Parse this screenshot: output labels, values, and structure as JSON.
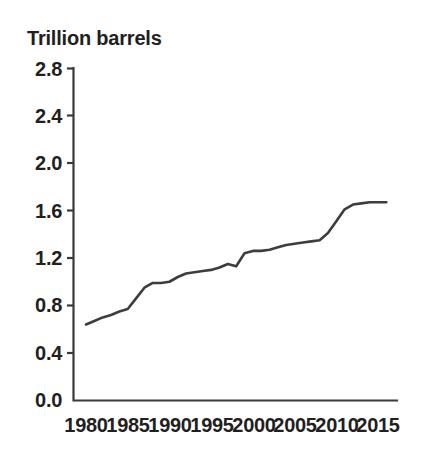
{
  "chart_data": {
    "type": "line",
    "title": "Trillion barrels",
    "subtitle": "",
    "xlabel": "",
    "ylabel": "Trillion barrels",
    "xlim": [
      1980,
      2016
    ],
    "ylim": [
      0.0,
      2.8
    ],
    "grid": false,
    "legend": false,
    "y_ticks": [
      "0.0",
      "0.4",
      "0.8",
      "1.2",
      "1.6",
      "2.0",
      "2.4",
      "2.8"
    ],
    "y_tick_values": [
      0.0,
      0.4,
      0.8,
      1.2,
      1.6,
      2.0,
      2.4,
      2.8
    ],
    "x_ticks": [
      "1980",
      "1985",
      "1990",
      "1995",
      "2000",
      "2005",
      "2010",
      "2015"
    ],
    "x_tick_values": [
      1980,
      1985,
      1990,
      1995,
      2000,
      2005,
      2010,
      2015
    ],
    "series": [
      {
        "name": "Proved oil reserves",
        "color": "#3d3d3d",
        "x": [
          1980,
          1981,
          1982,
          1983,
          1984,
          1985,
          1986,
          1987,
          1988,
          1989,
          1990,
          1991,
          1992,
          1993,
          1994,
          1995,
          1996,
          1997,
          1998,
          1999,
          2000,
          2001,
          2002,
          2003,
          2004,
          2005,
          2006,
          2007,
          2008,
          2009,
          2010,
          2011,
          2012,
          2013,
          2014,
          2015,
          2016
        ],
        "values": [
          0.64,
          0.67,
          0.7,
          0.72,
          0.75,
          0.77,
          0.86,
          0.95,
          0.99,
          0.99,
          1.0,
          1.04,
          1.07,
          1.08,
          1.09,
          1.1,
          1.12,
          1.15,
          1.13,
          1.24,
          1.26,
          1.26,
          1.27,
          1.29,
          1.31,
          1.32,
          1.33,
          1.34,
          1.35,
          1.41,
          1.51,
          1.61,
          1.65,
          1.66,
          1.67,
          1.67,
          1.67
        ]
      }
    ],
    "annotations": []
  },
  "axes": {
    "y_axis_name": "y-axis",
    "x_axis_name": "x-axis"
  }
}
